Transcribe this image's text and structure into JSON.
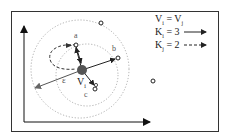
{
  "diagram": {
    "type": "density-based neighborhood illustration",
    "colors": {
      "frame": "#333333",
      "axis": "#111111",
      "circle": "#9a9a9a",
      "center_point": "#555555",
      "arrow": "#222222"
    },
    "center": {
      "label": "V",
      "subscript": "i"
    },
    "radius_label": "ε",
    "points": [
      {
        "id": "a",
        "label": "a"
      },
      {
        "id": "b",
        "label": "b"
      },
      {
        "id": "c",
        "label": "c"
      },
      {
        "id": "p4",
        "label": ""
      },
      {
        "id": "p5",
        "label": ""
      }
    ],
    "legend": [
      {
        "text_main": "V",
        "sub1": "i",
        "eq": " = V",
        "sub2": "j",
        "line": "none"
      },
      {
        "text_main": "K",
        "sub1": "i",
        "eq": " = 3",
        "line": "solid"
      },
      {
        "text_main": "K",
        "sub1": "j",
        "eq": " = 2",
        "line": "dashed"
      }
    ]
  }
}
